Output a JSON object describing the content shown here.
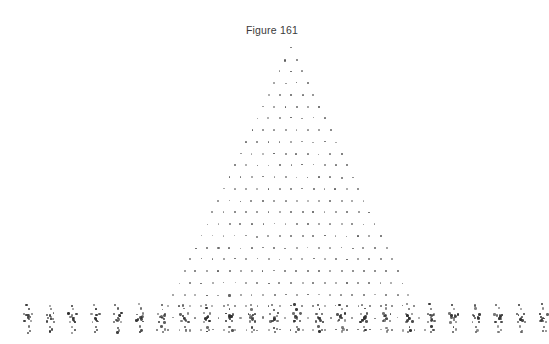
{
  "figure": {
    "title": "Figure 161",
    "title_x": 272,
    "title_y": 24,
    "background_color": "#ffffff"
  },
  "chart_data": {
    "type": "scatter",
    "title": "Figure 161",
    "subtitle": "",
    "xlabel": "",
    "ylabel": "",
    "xlim": [
      0,
      544
    ],
    "ylim": [
      344,
      0
    ],
    "grid": false,
    "legend": null,
    "axes_visible": false,
    "tick_labels_x": [],
    "tick_labels_y": [],
    "marker": {
      "shape": "dot",
      "color": "#5b5b5b",
      "size_px": 1.8
    },
    "cluster_marker": {
      "shape": "dot",
      "color": "#2f2f2f",
      "size_px": 2.2
    },
    "geometry": {
      "apex_x": 291,
      "apex_y": 48,
      "row_count": 25,
      "row_spacing_y": 11.75,
      "col_spacing_x": 11.2,
      "base_y": 330,
      "base_left_x": 20,
      "base_right_x": 535
    },
    "base_clusters": {
      "count": 24,
      "spacing_x": 22.4,
      "start_x": 28,
      "y": 318,
      "satellite_offsets": [
        [
          0,
          -9
        ],
        [
          0,
          9
        ],
        [
          -3.5,
          -4
        ],
        [
          3.5,
          -4
        ],
        [
          -3,
          3.5
        ],
        [
          3,
          3.5
        ],
        [
          0,
          0
        ],
        [
          0,
          14
        ],
        [
          -1.5,
          -13
        ],
        [
          2,
          12
        ]
      ]
    },
    "series": [
      {
        "name": "triangular-lattice",
        "point_count": 325,
        "rows": [
          {
            "row": 0,
            "count": 1,
            "y": 48
          },
          {
            "row": 1,
            "count": 2,
            "y": 60
          },
          {
            "row": 2,
            "count": 3,
            "y": 71
          },
          {
            "row": 3,
            "count": 4,
            "y": 83
          },
          {
            "row": 4,
            "count": 5,
            "y": 95
          },
          {
            "row": 5,
            "count": 6,
            "y": 107
          },
          {
            "row": 6,
            "count": 7,
            "y": 118
          },
          {
            "row": 7,
            "count": 8,
            "y": 130
          },
          {
            "row": 8,
            "count": 9,
            "y": 142
          },
          {
            "row": 9,
            "count": 10,
            "y": 154
          },
          {
            "row": 10,
            "count": 11,
            "y": 165
          },
          {
            "row": 11,
            "count": 12,
            "y": 177
          },
          {
            "row": 12,
            "count": 13,
            "y": 189
          },
          {
            "row": 13,
            "count": 14,
            "y": 201
          },
          {
            "row": 14,
            "count": 15,
            "y": 212
          },
          {
            "row": 15,
            "count": 16,
            "y": 224
          },
          {
            "row": 16,
            "count": 17,
            "y": 236
          },
          {
            "row": 17,
            "count": 18,
            "y": 248
          },
          {
            "row": 18,
            "count": 19,
            "y": 259
          },
          {
            "row": 19,
            "count": 20,
            "y": 271
          },
          {
            "row": 20,
            "count": 21,
            "y": 283
          },
          {
            "row": 21,
            "count": 22,
            "y": 295
          },
          {
            "row": 22,
            "count": 23,
            "y": 306
          },
          {
            "row": 23,
            "count": 24,
            "y": 318
          },
          {
            "row": 24,
            "count": 25,
            "y": 330
          }
        ]
      }
    ]
  }
}
